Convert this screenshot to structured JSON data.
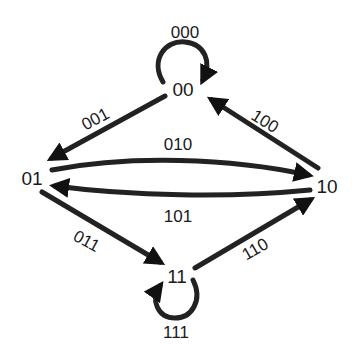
{
  "diagram": {
    "type": "state-transition",
    "nodes": [
      {
        "id": "00",
        "label": "00"
      },
      {
        "id": "01",
        "label": "01"
      },
      {
        "id": "10",
        "label": "10"
      },
      {
        "id": "11",
        "label": "11"
      }
    ],
    "edges": [
      {
        "from": "00",
        "to": "00",
        "label": "000"
      },
      {
        "from": "00",
        "to": "01",
        "label": "001"
      },
      {
        "from": "01",
        "to": "10",
        "label": "010"
      },
      {
        "from": "10",
        "to": "00",
        "label": "100"
      },
      {
        "from": "10",
        "to": "01",
        "label": "101"
      },
      {
        "from": "01",
        "to": "11",
        "label": "011"
      },
      {
        "from": "11",
        "to": "10",
        "label": "110"
      },
      {
        "from": "11",
        "to": "11",
        "label": "111"
      }
    ]
  }
}
